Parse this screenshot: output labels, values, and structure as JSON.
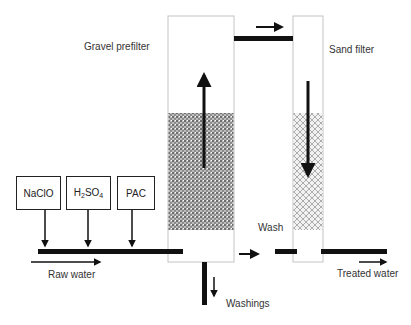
{
  "diagram": {
    "labels": {
      "gravel_prefilter": "Gravel prefilter",
      "sand_filter": "Sand filter",
      "wash": "Wash",
      "raw_water": "Raw water",
      "treated_water": "Treated water",
      "washings": "Washings"
    },
    "chemicals": [
      {
        "label": "NaClO"
      },
      {
        "label_main": "H",
        "sub1": "2",
        "mid": "SO",
        "sub2": "4"
      },
      {
        "label": "PAC"
      }
    ],
    "colors": {
      "line": "#111111",
      "column_border": "#bbbbbb",
      "gravel_fill": "#8a8a8a",
      "sand_fill": "#c8c8c8"
    }
  }
}
